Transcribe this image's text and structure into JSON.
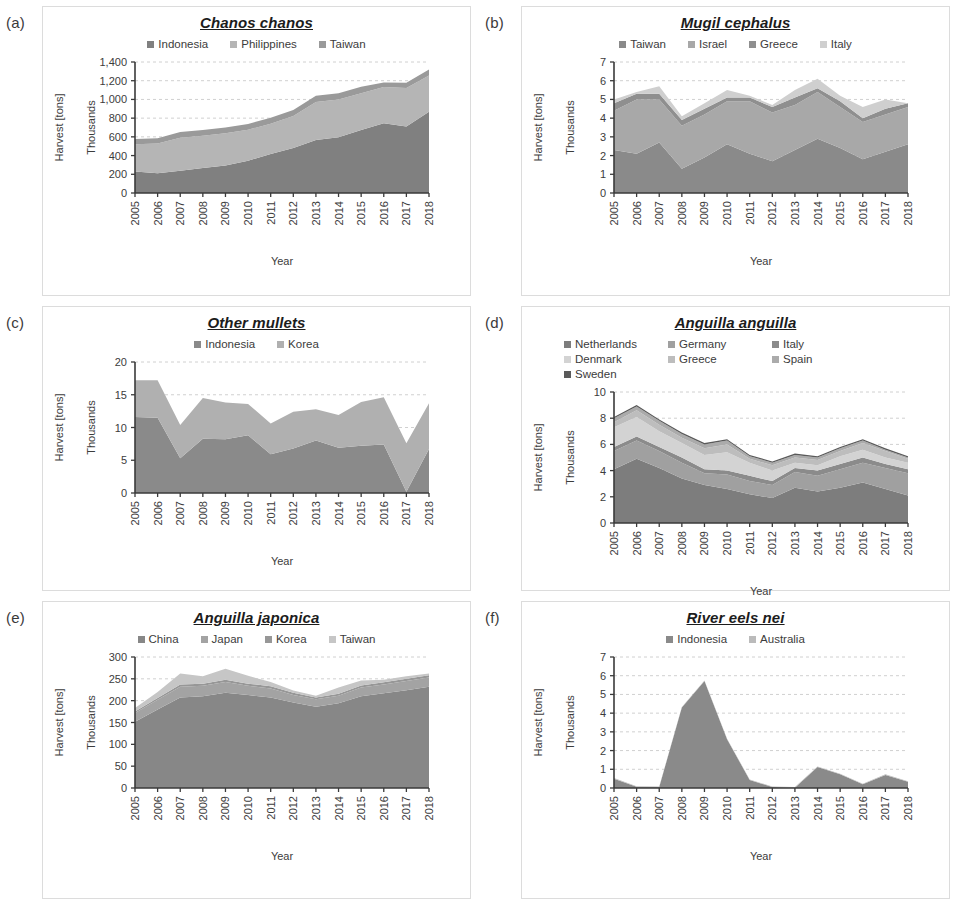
{
  "figure": {
    "panels": [
      {
        "letter": "(a)",
        "title": "Chanos chanos",
        "ylabel": "Harvest [tons]",
        "unit_label": "Thousands",
        "xlabel": "Year"
      },
      {
        "letter": "(b)",
        "title": "Mugil cephalus",
        "ylabel": "Harvest [tons]",
        "unit_label": "Thousands",
        "xlabel": "Year"
      },
      {
        "letter": "(c)",
        "title": "Other mullets",
        "ylabel": "Harvest [tons]",
        "unit_label": "Thousands",
        "xlabel": "Year"
      },
      {
        "letter": "(d)",
        "title": "Anguilla anguilla",
        "ylabel": "Harvest [tons]",
        "unit_label": "Thousands",
        "xlabel": "Year"
      },
      {
        "letter": "(e)",
        "title": "Anguilla japonica",
        "ylabel": "Harvest [tons]",
        "unit_label": "Thousands",
        "xlabel": "Year"
      },
      {
        "letter": "(f)",
        "title": "River eels nei",
        "ylabel": "Harvest [tons]",
        "unit_label": "Thousands",
        "xlabel": "Year"
      }
    ]
  },
  "chart_data": [
    {
      "type": "area",
      "stacked": true,
      "panel": "(a)",
      "title": "Chanos chanos",
      "xlabel": "Year",
      "ylabel": "Harvest [tons]",
      "unit": "Thousands",
      "x": [
        2005,
        2006,
        2007,
        2008,
        2009,
        2010,
        2011,
        2012,
        2013,
        2014,
        2015,
        2016,
        2017,
        2018
      ],
      "xlim": [
        2005,
        2018
      ],
      "ylim": [
        0,
        1400
      ],
      "yticks": [
        0,
        200,
        400,
        600,
        800,
        1000,
        1200,
        1400
      ],
      "ytick_labels": [
        "0",
        "200",
        "400",
        "600",
        "800",
        "1,000",
        "1,200",
        "1,400"
      ],
      "grid": true,
      "legend_position": "top",
      "series": [
        {
          "name": "Indonesia",
          "color": "#808080",
          "values": [
            231,
            212,
            238,
            266,
            294,
            345,
            418,
            482,
            567,
            596,
            674,
            745,
            712,
            869
          ]
        },
        {
          "name": "Philippines",
          "color": "#b5b5b5",
          "values": [
            289,
            317,
            353,
            345,
            345,
            331,
            323,
            341,
            405,
            404,
            391,
            387,
            409,
            386
          ]
        },
        {
          "name": "Taiwan",
          "color": "#9a9a9a",
          "values": [
            58,
            55,
            60,
            62,
            61,
            62,
            63,
            65,
            66,
            66,
            71,
            49,
            56,
            66
          ]
        }
      ]
    },
    {
      "type": "area",
      "stacked": true,
      "panel": "(b)",
      "title": "Mugil cephalus",
      "xlabel": "Year",
      "ylabel": "Harvest [tons]",
      "unit": "Thousands",
      "x": [
        2005,
        2006,
        2007,
        2008,
        2009,
        2010,
        2011,
        2012,
        2013,
        2014,
        2015,
        2016,
        2017,
        2018
      ],
      "xlim": [
        2005,
        2018
      ],
      "ylim": [
        0,
        7
      ],
      "yticks": [
        0,
        1,
        2,
        3,
        4,
        5,
        6,
        7
      ],
      "ytick_labels": [
        "0",
        "1",
        "2",
        "3",
        "4",
        "5",
        "6",
        "7"
      ],
      "grid": true,
      "legend_position": "top",
      "series": [
        {
          "name": "Taiwan",
          "color": "#8a8a8a",
          "values": [
            2.3,
            2.1,
            2.7,
            1.3,
            1.9,
            2.6,
            2.1,
            1.7,
            2.3,
            2.9,
            2.4,
            1.8,
            2.2,
            2.6
          ]
        },
        {
          "name": "Israel",
          "color": "#a8a8a8",
          "values": [
            2.1,
            2.9,
            2.3,
            2.3,
            2.3,
            2.3,
            2.8,
            2.6,
            2.4,
            2.5,
            2.2,
            2.0,
            2.0,
            2.0
          ]
        },
        {
          "name": "Greece",
          "color": "#8f8f8f",
          "values": [
            0.4,
            0.3,
            0.3,
            0.3,
            0.3,
            0.2,
            0.2,
            0.3,
            0.4,
            0.2,
            0.3,
            0.2,
            0.3,
            0.2
          ]
        },
        {
          "name": "Italy",
          "color": "#cfcfcf",
          "values": [
            0.2,
            0.1,
            0.4,
            0.2,
            0.3,
            0.4,
            0.1,
            0.1,
            0.4,
            0.5,
            0.3,
            0.6,
            0.5,
            0.0
          ]
        }
      ]
    },
    {
      "type": "area",
      "stacked": true,
      "panel": "(c)",
      "title": "Other mullets",
      "xlabel": "Year",
      "ylabel": "Harvest [tons]",
      "unit": "Thousands",
      "x": [
        2005,
        2006,
        2007,
        2008,
        2009,
        2010,
        2011,
        2012,
        2013,
        2014,
        2015,
        2016,
        2017,
        2018
      ],
      "xlim": [
        2005,
        2018
      ],
      "ylim": [
        0,
        20
      ],
      "yticks": [
        0,
        5,
        10,
        15,
        20
      ],
      "ytick_labels": [
        "0",
        "5",
        "10",
        "15",
        "20"
      ],
      "grid": true,
      "legend_position": "top",
      "series": [
        {
          "name": "Indonesia",
          "color": "#8a8a8a",
          "values": [
            11.6,
            11.5,
            5.3,
            8.3,
            8.2,
            8.8,
            5.9,
            6.8,
            8.0,
            6.9,
            7.2,
            7.4,
            0.2,
            6.7
          ]
        },
        {
          "name": "Korea",
          "color": "#b0b0b0",
          "values": [
            5.6,
            5.7,
            5.1,
            6.2,
            5.6,
            4.8,
            4.7,
            5.6,
            4.8,
            5.0,
            6.7,
            7.2,
            7.4,
            7.0
          ]
        }
      ]
    },
    {
      "type": "area",
      "stacked": true,
      "panel": "(d)",
      "title": "Anguilla anguilla",
      "xlabel": "Year",
      "ylabel": "Harvest [tons]",
      "unit": "Thousands",
      "x": [
        2005,
        2006,
        2007,
        2008,
        2009,
        2010,
        2011,
        2012,
        2013,
        2014,
        2015,
        2016,
        2017,
        2018
      ],
      "xlim": [
        2005,
        2018
      ],
      "ylim": [
        0,
        10
      ],
      "yticks": [
        0,
        2,
        4,
        6,
        8,
        10
      ],
      "ytick_labels": [
        "0",
        "2",
        "4",
        "6",
        "8",
        "10"
      ],
      "grid": true,
      "legend_position": "top",
      "series": [
        {
          "name": "Netherlands",
          "color": "#7d7d7d",
          "values": [
            4.1,
            4.9,
            4.2,
            3.4,
            2.9,
            2.6,
            2.2,
            1.9,
            2.7,
            2.4,
            2.7,
            3.1,
            2.6,
            2.1
          ]
        },
        {
          "name": "Germany",
          "color": "#a0a0a0",
          "values": [
            1.4,
            1.4,
            1.3,
            1.2,
            0.9,
            1.1,
            1.0,
            1.0,
            1.2,
            1.2,
            1.4,
            1.5,
            1.6,
            1.7
          ]
        },
        {
          "name": "Italy",
          "color": "#8b8b8b",
          "values": [
            0.3,
            0.3,
            0.3,
            0.4,
            0.3,
            0.3,
            0.4,
            0.3,
            0.3,
            0.4,
            0.4,
            0.4,
            0.3,
            0.3
          ]
        },
        {
          "name": "Denmark",
          "color": "#d3d3d3",
          "values": [
            1.5,
            1.5,
            1.2,
            1.1,
            1.1,
            1.4,
            1.0,
            0.8,
            0.4,
            0.4,
            0.6,
            0.6,
            0.5,
            0.5
          ]
        },
        {
          "name": "Greece",
          "color": "#bdbdbd",
          "values": [
            0.4,
            0.5,
            0.5,
            0.4,
            0.5,
            0.6,
            0.3,
            0.4,
            0.4,
            0.4,
            0.4,
            0.5,
            0.5,
            0.3
          ]
        },
        {
          "name": "Spain",
          "color": "#ababab",
          "values": [
            0.3,
            0.3,
            0.3,
            0.3,
            0.3,
            0.3,
            0.2,
            0.2,
            0.2,
            0.2,
            0.2,
            0.2,
            0.1,
            0.1
          ]
        },
        {
          "name": "Sweden",
          "color": "#5a5a5a",
          "values": [
            0.1,
            0.1,
            0.1,
            0.1,
            0.1,
            0.1,
            0.1,
            0.1,
            0.1,
            0.1,
            0.1,
            0.1,
            0.1,
            0.1
          ]
        }
      ]
    },
    {
      "type": "area",
      "stacked": true,
      "panel": "(e)",
      "title": "Anguilla japonica",
      "xlabel": "Year",
      "ylabel": "Harvest [tons]",
      "unit": "Thousands",
      "x": [
        2005,
        2006,
        2007,
        2008,
        2009,
        2010,
        2011,
        2012,
        2013,
        2014,
        2015,
        2016,
        2017,
        2018
      ],
      "xlim": [
        2005,
        2018
      ],
      "ylim": [
        0,
        300
      ],
      "yticks": [
        0,
        50,
        100,
        150,
        200,
        250,
        300
      ],
      "ytick_labels": [
        "0",
        "50",
        "100",
        "150",
        "200",
        "250",
        "300"
      ],
      "grid": true,
      "legend_position": "top",
      "series": [
        {
          "name": "China",
          "color": "#878787",
          "values": [
            152,
            180,
            207,
            210,
            218,
            213,
            207,
            196,
            186,
            194,
            210,
            217,
            224,
            232
          ]
        },
        {
          "name": "Japan",
          "color": "#a3a3a3",
          "values": [
            20,
            22,
            25,
            24,
            25,
            21,
            21,
            17,
            17,
            17,
            20,
            20,
            21,
            21
          ]
        },
        {
          "name": "Korea",
          "color": "#979797",
          "values": [
            3,
            4,
            5,
            5,
            5,
            5,
            5,
            5,
            4,
            5,
            5,
            5,
            5,
            5
          ]
        },
        {
          "name": "Taiwan",
          "color": "#c6c6c6",
          "values": [
            8,
            14,
            25,
            17,
            25,
            18,
            10,
            5,
            4,
            14,
            11,
            6,
            6,
            4
          ]
        }
      ]
    },
    {
      "type": "area",
      "stacked": true,
      "panel": "(f)",
      "title": "River eels nei",
      "xlabel": "Year",
      "ylabel": "Harvest [tons]",
      "unit": "Thousands",
      "x": [
        2005,
        2006,
        2007,
        2008,
        2009,
        2010,
        2011,
        2012,
        2013,
        2014,
        2015,
        2016,
        2017,
        2018
      ],
      "xlim": [
        2005,
        2018
      ],
      "ylim": [
        0,
        7
      ],
      "yticks": [
        0,
        1,
        2,
        3,
        4,
        5,
        6,
        7
      ],
      "ytick_labels": [
        "0",
        "1",
        "2",
        "3",
        "4",
        "5",
        "6",
        "7"
      ],
      "grid": true,
      "legend_position": "top",
      "series": [
        {
          "name": "Indonesia",
          "color": "#8a8a8a",
          "values": [
            0.5,
            0.07,
            0.05,
            4.3,
            5.72,
            2.6,
            0.43,
            0.05,
            0.02,
            1.12,
            0.73,
            0.2,
            0.7,
            0.33
          ]
        },
        {
          "name": "Australia",
          "color": "#bbbbbb",
          "values": [
            0.03,
            0.03,
            0.03,
            0.03,
            0.03,
            0.03,
            0.03,
            0.03,
            0.03,
            0.03,
            0.03,
            0.03,
            0.03,
            0.03
          ]
        }
      ]
    }
  ]
}
